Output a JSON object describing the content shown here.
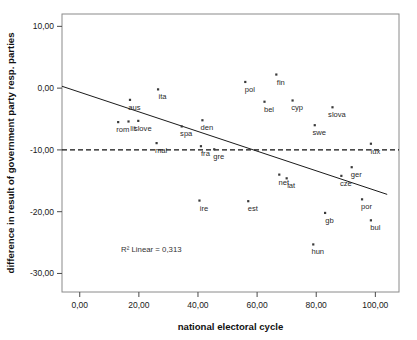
{
  "chart_data": {
    "type": "scatter",
    "title": "",
    "xlabel": "national electoral cycle",
    "ylabel": "difference in result of government party resp. parties",
    "xlim": [
      -6,
      108
    ],
    "ylim": [
      -33,
      12
    ],
    "xticks": [
      "0,00",
      "20,00",
      "40,00",
      "60,00",
      "80,00",
      "100,00"
    ],
    "xtick_values": [
      0,
      20,
      40,
      60,
      80,
      100
    ],
    "yticks": [
      "10,00",
      "0,00",
      "-10,00",
      "-20,00",
      "-30,00"
    ],
    "ytick_values": [
      10,
      0,
      -10,
      -20,
      -30
    ],
    "grid": false,
    "legend": null,
    "annotations": [
      {
        "name": "r-squared",
        "text": "R² Linear = 0,313",
        "x": 14,
        "y": -26.6
      }
    ],
    "reference_line": {
      "name": "zero-change-reference",
      "orientation": "horizontal",
      "value": -10,
      "style": "dashed"
    },
    "fit_line": {
      "name": "linear-regression-fit",
      "style": "solid",
      "x_start": -6,
      "y_start": 0.3,
      "x_end": 104,
      "y_end": -17.2
    },
    "points": [
      {
        "label": "aus",
        "x": 17.0,
        "y": -1.9
      },
      {
        "label": "ita",
        "x": 26.5,
        "y": -0.2
      },
      {
        "label": "rom",
        "x": 13.0,
        "y": -5.5
      },
      {
        "label": "lit",
        "x": 16.5,
        "y": -5.4
      },
      {
        "label": "slove",
        "x": 19.8,
        "y": -5.3
      },
      {
        "label": "spa",
        "x": 34.5,
        "y": -6.2
      },
      {
        "label": "den",
        "x": 41.5,
        "y": -5.2
      },
      {
        "label": "mal",
        "x": 26.0,
        "y": -8.9
      },
      {
        "label": "fra",
        "x": 41.0,
        "y": -9.4
      },
      {
        "label": "gre",
        "x": 45.5,
        "y": -9.9
      },
      {
        "label": "pol",
        "x": 56.0,
        "y": 1.0
      },
      {
        "label": "bel",
        "x": 62.5,
        "y": -2.2
      },
      {
        "label": "fin",
        "x": 66.5,
        "y": 2.2
      },
      {
        "label": "cyp",
        "x": 72.0,
        "y": -2.0
      },
      {
        "label": "slova",
        "x": 85.5,
        "y": -3.1
      },
      {
        "label": "swe",
        "x": 79.5,
        "y": -6.0
      },
      {
        "label": "lux",
        "x": 98.5,
        "y": -9.0
      },
      {
        "label": "net",
        "x": 67.5,
        "y": -14.0
      },
      {
        "label": "lat",
        "x": 70.0,
        "y": -14.6
      },
      {
        "label": "ire",
        "x": 40.5,
        "y": -18.2
      },
      {
        "label": "est",
        "x": 57.0,
        "y": -18.3
      },
      {
        "label": "ger",
        "x": 92.0,
        "y": -12.8
      },
      {
        "label": "cze",
        "x": 88.5,
        "y": -14.2
      },
      {
        "label": "por",
        "x": 95.5,
        "y": -18.0
      },
      {
        "label": "gb",
        "x": 83.0,
        "y": -20.2
      },
      {
        "label": "bul",
        "x": 98.5,
        "y": -21.4
      },
      {
        "label": "hun",
        "x": 79.0,
        "y": -25.3
      }
    ]
  }
}
